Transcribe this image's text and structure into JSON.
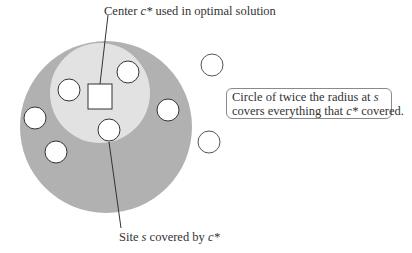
{
  "diagram": {
    "colors": {
      "outer_circle": "#b1b1b1",
      "inner_circle": "#e2e2e2",
      "site_fill": "#ffffff",
      "stroke": "#333333",
      "text": "#333333"
    },
    "labels": {
      "top": {
        "prefix": "Center ",
        "var": "c*",
        "suffix": " used in optimal solution"
      },
      "bottom": {
        "prefix": "Site ",
        "var": "s",
        "middle": " covered by ",
        "var2": "c*"
      },
      "callout": {
        "line1_prefix": "Circle of twice the radius at ",
        "line1_var": "s",
        "line2_prefix": "covers everything that ",
        "line2_var": "c*",
        "line2_suffix": " covered."
      }
    },
    "shapes": {
      "outer_circle": {
        "cx": 106,
        "cy": 127,
        "r": 86
      },
      "inner_circle": {
        "cx": 100,
        "cy": 93,
        "r": 50
      },
      "center_square": {
        "x": 88,
        "y": 84,
        "w": 24,
        "h": 25
      },
      "sites": [
        {
          "cx": 69,
          "cy": 90,
          "r": 11,
          "inside": true
        },
        {
          "cx": 128,
          "cy": 72,
          "r": 11,
          "inside": true
        },
        {
          "cx": 35,
          "cy": 118,
          "r": 11,
          "inside": true
        },
        {
          "cx": 168,
          "cy": 110,
          "r": 11,
          "inside": true
        },
        {
          "cx": 109,
          "cy": 130,
          "r": 11,
          "inside": true,
          "is_site_s": true
        },
        {
          "cx": 56,
          "cy": 152,
          "r": 11,
          "inside": true
        },
        {
          "cx": 212,
          "cy": 65,
          "r": 11,
          "inside": false
        },
        {
          "cx": 209,
          "cy": 142,
          "r": 11,
          "inside": false
        }
      ],
      "leader_lines": [
        {
          "x1": 108,
          "y1": 15,
          "x2": 100,
          "y2": 84
        },
        {
          "x1": 109,
          "y1": 142,
          "x2": 121,
          "y2": 228
        }
      ]
    }
  }
}
